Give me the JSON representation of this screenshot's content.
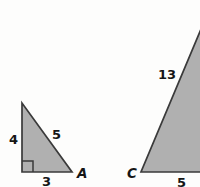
{
  "figure": {
    "background_color": "#fdfdfc",
    "fill_color": "#b0b0b0",
    "stroke_color": "#3a3a3a",
    "text_color": "#161616",
    "triangles": [
      {
        "id": "left-triangle",
        "name": "small-triangle",
        "vertices": [
          {
            "x": 22,
            "y": 103
          },
          {
            "x": 22,
            "y": 172
          },
          {
            "x": 72,
            "y": 172
          }
        ],
        "right_angle_at": {
          "x": 22,
          "y": 172
        },
        "right_angle_marker": true,
        "side_labels": {
          "vertical_leg": "4",
          "hypotenuse": "5",
          "base": "3"
        },
        "vertex_labels": {
          "bottom_right": "A"
        },
        "clipped": false
      },
      {
        "id": "right-triangle",
        "name": "large-triangle",
        "vertices": [
          {
            "x": 204,
            "y": 22
          },
          {
            "x": 141,
            "y": 172
          },
          {
            "x": 210,
            "y": 172
          }
        ],
        "right_angle_at": null,
        "right_angle_marker": false,
        "side_labels": {
          "hypotenuse": "13",
          "base": "5"
        },
        "vertex_labels": {
          "bottom_left": "C"
        },
        "clipped": true
      }
    ],
    "labels": {
      "left_leg": "4",
      "left_hypotenuse": "5",
      "left_base": "3",
      "vertex_a": "A",
      "right_hypotenuse": "13",
      "vertex_c": "C",
      "right_base": "5"
    }
  }
}
